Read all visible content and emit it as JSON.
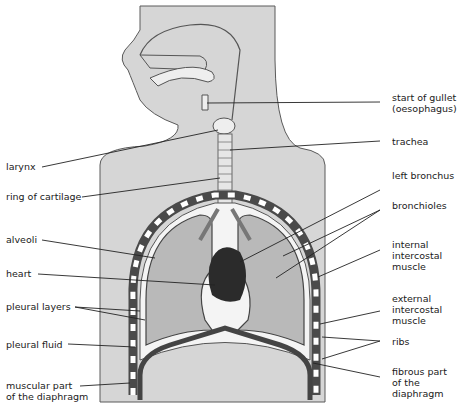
{
  "diagram": {
    "colors": {
      "body_fill": "#d6d6d6",
      "outline": "#3a3a3a",
      "lung_fill": "#b9b9b9",
      "pleural_space": "#f4f4f4",
      "heart": "#2b2b2b",
      "rib_dark": "#4a4a4a",
      "rib_light": "#ffffff"
    },
    "labels_left": [
      {
        "id": "larynx",
        "text": "larynx"
      },
      {
        "id": "ring-of-cartilage",
        "text": "ring of cartilage"
      },
      {
        "id": "alveoli",
        "text": "alveoli"
      },
      {
        "id": "heart",
        "text": "heart"
      },
      {
        "id": "pleural-layers",
        "text": "pleural layers"
      },
      {
        "id": "pleural-fluid",
        "text": "pleural fluid"
      },
      {
        "id": "muscular-diaphragm",
        "text": "muscular part\nof the diaphragm"
      }
    ],
    "labels_right": [
      {
        "id": "gullet",
        "text": "start of gullet\n(oesophagus)"
      },
      {
        "id": "trachea",
        "text": "trachea"
      },
      {
        "id": "left-bronchus",
        "text": "left bronchus"
      },
      {
        "id": "bronchioles",
        "text": "bronchioles"
      },
      {
        "id": "internal-intercostal",
        "text": "internal\nintercostal\nmuscle"
      },
      {
        "id": "external-intercostal",
        "text": "external\nintercostal\nmuscle"
      },
      {
        "id": "ribs",
        "text": "ribs"
      },
      {
        "id": "fibrous-diaphragm",
        "text": "fibrous part\nof the\ndiaphragm"
      }
    ]
  }
}
